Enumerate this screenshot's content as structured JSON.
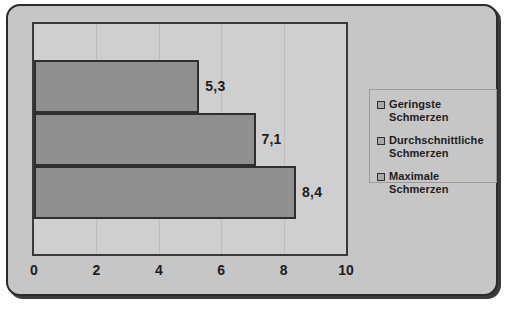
{
  "chart_data": {
    "type": "bar",
    "orientation": "horizontal",
    "title": "",
    "xlabel": "",
    "ylabel": "",
    "xlim": [
      0,
      10
    ],
    "grid": true,
    "legend_position": "right",
    "categories": [
      "Geringste Schmerzen",
      "Durchschnittliche Schmerzen",
      "Maximale Schmerzen"
    ],
    "values": [
      5.3,
      7.1,
      8.4
    ],
    "value_labels": [
      "5,3",
      "7,1",
      "8,4"
    ],
    "x_ticks": [
      0,
      2,
      4,
      6,
      8,
      10
    ],
    "x_tick_labels": [
      "0",
      "2",
      "4",
      "6",
      "8",
      "10"
    ],
    "colors": {
      "bar_fill": "#8f8f8f",
      "bar_border": "#2f2f2f",
      "plot_background": "#cfcfcf",
      "panel_background": "#c6c6c6",
      "panel_border": "#2b2b2b",
      "text": "#1d1d1d",
      "gridline": "#bdbdbd"
    }
  },
  "legend": {
    "items": [
      {
        "label": "Geringste Schmerzen",
        "swatch": "legend-swatch-icon"
      },
      {
        "label": "Durchschnittliche Schmerzen",
        "swatch": "legend-swatch-icon"
      },
      {
        "label": "Maximale Schmerzen",
        "swatch": "legend-swatch-icon"
      }
    ]
  }
}
